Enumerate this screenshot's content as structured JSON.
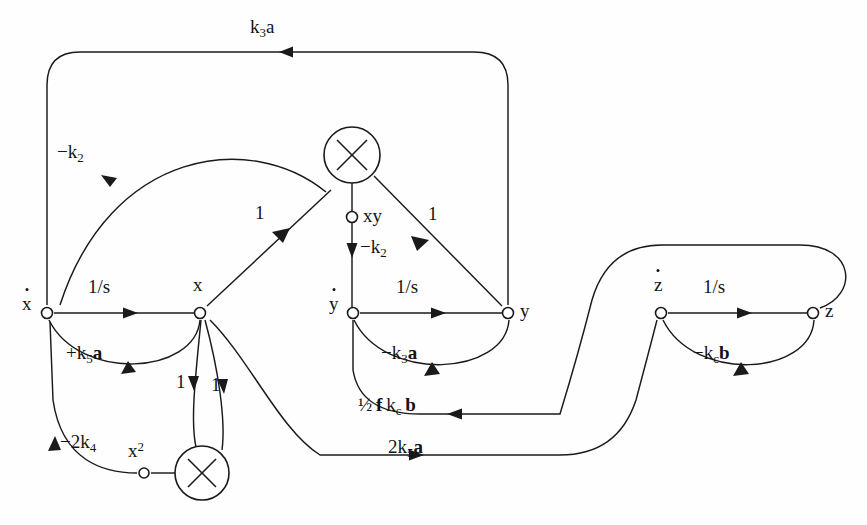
{
  "diagram": {
    "stroke_color": "#1a1a1a",
    "background": "#ffffff",
    "nodes": [
      {
        "id": "xdot",
        "label": "x",
        "dot": true,
        "x": 47,
        "y": 313,
        "label_dx": -18,
        "label_dy": -12
      },
      {
        "id": "x",
        "label": "x",
        "dot": false,
        "x": 200,
        "y": 313,
        "label_dx": -5,
        "label_dy": -32
      },
      {
        "id": "ydot",
        "label": "y",
        "dot": true,
        "x": 353,
        "y": 313,
        "label_dx": -18,
        "label_dy": -12
      },
      {
        "id": "y",
        "label": "y",
        "dot": false,
        "x": 508,
        "y": 313,
        "label_dx": 11,
        "label_dy": -12
      },
      {
        "id": "zdot",
        "label": "z",
        "dot": true,
        "x": 661,
        "y": 313,
        "label_dx": -5,
        "label_dy": -34
      },
      {
        "id": "z",
        "label": "z",
        "dot": false,
        "x": 813,
        "y": 313,
        "label_dx": 11,
        "label_dy": -12
      },
      {
        "id": "xy",
        "label": "xy",
        "dot": false,
        "x": 352,
        "y": 217,
        "label_dx": 10,
        "label_dy": -11
      },
      {
        "id": "x2",
        "label": "x",
        "sup": "2",
        "dot": false,
        "x": 144,
        "y": 473,
        "label_dx": -14,
        "label_dy": -31
      }
    ],
    "multipliers": [
      {
        "id": "mult-top",
        "cx": 352,
        "cy": 155,
        "r": 28
      },
      {
        "id": "mult-bottom",
        "cx": 202,
        "cy": 473,
        "r": 27
      }
    ],
    "edge_labels": [
      {
        "id": "k3a",
        "text": "k3a",
        "html": "k<sub>3</sub>a",
        "x": 268,
        "y": 26
      },
      {
        "id": "neg-k2-top",
        "text": "-k2",
        "html": "&minus;k<sub>2</sub>",
        "x": 68,
        "y": 152
      },
      {
        "id": "one-left",
        "text": "1",
        "html": "1",
        "x": 259,
        "y": 213
      },
      {
        "id": "one-right",
        "text": "1",
        "html": "1",
        "x": 432,
        "y": 214
      },
      {
        "id": "neg-k2-mid",
        "text": "-k2",
        "html": "&minus;k<sub>2</sub>",
        "x": 362,
        "y": 246
      },
      {
        "id": "inv-s-x",
        "text": "1/s",
        "html": "1/s",
        "x": 103,
        "y": 287
      },
      {
        "id": "inv-s-y",
        "text": "1/s",
        "html": "1/s",
        "x": 411,
        "y": 287
      },
      {
        "id": "inv-s-z",
        "text": "1/s",
        "html": "1/s",
        "x": 718,
        "y": 287
      },
      {
        "id": "plus-k5a",
        "text": "+k5a",
        "html": "+k<sub>5</sub><b>a</b>",
        "x": 86,
        "y": 352
      },
      {
        "id": "neg-k3a",
        "text": "-k3a",
        "html": "&minus;k<sub>3</sub><b>a</b>",
        "x": 401,
        "y": 352
      },
      {
        "id": "neg-kcb",
        "text": "-kcb",
        "html": "&minus;k<sub>c</sub><b>b</b>",
        "x": 713,
        "y": 352
      },
      {
        "id": "one-a",
        "text": "1",
        "html": "1",
        "x": 180,
        "y": 381
      },
      {
        "id": "one-b",
        "text": "1",
        "html": "1",
        "x": 215,
        "y": 384
      },
      {
        "id": "half-fkcb",
        "text": "1/2 f kc b",
        "html": "&frac12;&thinsp;<b>f</b>&thinsp;k<sub>c</sub>&thinsp;<b>b</b>",
        "x": 396,
        "y": 405
      },
      {
        "id": "neg-2k4",
        "text": "-2k4",
        "html": "&minus;2k<sub>4</sub>",
        "x": 79,
        "y": 442
      },
      {
        "id": "two-k5a",
        "text": "2k5a",
        "html": "2k<sub>5</sub><b>a</b>",
        "x": 412,
        "y": 447
      }
    ]
  }
}
